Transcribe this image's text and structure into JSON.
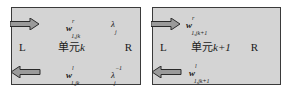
{
  "diagram": {
    "cells": [
      {
        "id": "cell-k",
        "name_prefix": "单元",
        "name_index": "k",
        "left_label": "L",
        "right_label": "R",
        "top_var": {
          "base": "w",
          "sup": "r",
          "sub": "1,jk"
        },
        "bottom_var": {
          "base": "w",
          "sup": "l",
          "sub": "1,jk"
        },
        "top_lambda": {
          "base": "λ",
          "sub": "j",
          "sup": ""
        },
        "bottom_lambda": {
          "base": "λ",
          "sub": "j",
          "sup": "−1"
        },
        "arrows": {
          "top": "right",
          "bottom": "left"
        }
      },
      {
        "id": "cell-k1",
        "name_prefix": "单元",
        "name_index": "k+1",
        "left_label": "L",
        "right_label": "R",
        "top_var": {
          "base": "w",
          "sup": "r",
          "sub": "1,jk+1"
        },
        "bottom_var": {
          "base": "w",
          "sup": "l",
          "sub": "1,jk+1"
        },
        "arrows": {
          "top": "right",
          "bottom": "left"
        }
      }
    ],
    "colors": {
      "cell_fill": "#d4d4d4",
      "border": "#3a3a3a",
      "arrow_fill": "#9a9a9a"
    }
  }
}
